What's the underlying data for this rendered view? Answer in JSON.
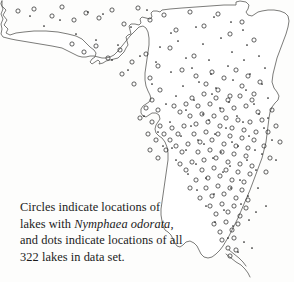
{
  "figure": {
    "kind": "distribution-map",
    "region": "Florida",
    "background_color": "#fdfdfc",
    "outline_color": "#5a5a58",
    "marker_color": "#2e2e2e",
    "dot_color": "#1a1a1a"
  },
  "caption": {
    "line1": "Circles indicate locations of",
    "line2_prefix": "lakes with ",
    "line2_species": "Nymphaea odorata",
    "line2_suffix": ",",
    "line3": "and dots indicate locations of all",
    "line4": "322 lakes in data set."
  },
  "legend_semantics": {
    "circle_meaning": "locations of lakes with Nymphaea odorata",
    "dot_meaning": "locations of all lakes in data set",
    "total_lakes": "322"
  },
  "chart_data": {
    "type": "scatter",
    "title": "",
    "xlabel": "",
    "ylabel": "",
    "grid": false,
    "legend_position": "caption-below",
    "xlim": [
      0,
      294
    ],
    "ylim": [
      0,
      282
    ],
    "series": [
      {
        "name": "All lakes in data set (dots)",
        "marker": "dot",
        "count_label": "322",
        "points": [
          [
            103,
            14
          ],
          [
            147,
            10
          ],
          [
            171,
            33
          ],
          [
            196,
            27
          ],
          [
            214,
            17
          ],
          [
            231,
            22
          ],
          [
            243,
            30
          ],
          [
            96,
            40
          ],
          [
            118,
            45
          ],
          [
            131,
            27
          ],
          [
            160,
            47
          ],
          [
            178,
            41
          ],
          [
            203,
            44
          ],
          [
            221,
            38
          ],
          [
            140,
            56
          ],
          [
            156,
            62
          ],
          [
            186,
            58
          ],
          [
            209,
            60
          ],
          [
            232,
            52
          ],
          [
            247,
            45
          ],
          [
            171,
            72
          ],
          [
            192,
            68
          ],
          [
            211,
            74
          ],
          [
            228,
            66
          ],
          [
            244,
            60
          ],
          [
            259,
            56
          ],
          [
            183,
            86
          ],
          [
            199,
            82
          ],
          [
            216,
            88
          ],
          [
            233,
            80
          ],
          [
            250,
            74
          ],
          [
            265,
            68
          ],
          [
            176,
            96
          ],
          [
            194,
            100
          ],
          [
            212,
            94
          ],
          [
            229,
            102
          ],
          [
            246,
            90
          ],
          [
            262,
            84
          ],
          [
            186,
            110
          ],
          [
            203,
            114
          ],
          [
            220,
            108
          ],
          [
            237,
            116
          ],
          [
            254,
            104
          ],
          [
            268,
            98
          ],
          [
            170,
            122
          ],
          [
            191,
            126
          ],
          [
            209,
            120
          ],
          [
            226,
            128
          ],
          [
            243,
            122
          ],
          [
            259,
            114
          ],
          [
            181,
            136
          ],
          [
            198,
            140
          ],
          [
            215,
            134
          ],
          [
            232,
            142
          ],
          [
            249,
            136
          ],
          [
            264,
            128
          ],
          [
            163,
            146
          ],
          [
            186,
            150
          ],
          [
            204,
            144
          ],
          [
            221,
            152
          ],
          [
            238,
            146
          ],
          [
            255,
            150
          ],
          [
            176,
            160
          ],
          [
            196,
            164
          ],
          [
            213,
            158
          ],
          [
            230,
            166
          ],
          [
            247,
            160
          ],
          [
            262,
            154
          ],
          [
            188,
            174
          ],
          [
            206,
            178
          ],
          [
            223,
            172
          ],
          [
            240,
            180
          ],
          [
            256,
            170
          ],
          [
            197,
            190
          ],
          [
            214,
            194
          ],
          [
            231,
            188
          ],
          [
            248,
            196
          ],
          [
            206,
            206
          ],
          [
            224,
            210
          ],
          [
            241,
            204
          ],
          [
            256,
            212
          ],
          [
            215,
            222
          ],
          [
            233,
            226
          ],
          [
            249,
            220
          ],
          [
            228,
            238
          ],
          [
            244,
            242
          ],
          [
            238,
            252
          ],
          [
            252,
            248
          ],
          [
            60,
            20
          ],
          [
            76,
            34
          ],
          [
            88,
            12
          ],
          [
            112,
            60
          ],
          [
            128,
            70
          ],
          [
            44,
            26
          ],
          [
            30,
            16
          ],
          [
            152,
            84
          ],
          [
            166,
            104
          ],
          [
            144,
            116
          ],
          [
            158,
            132
          ],
          [
            172,
            148
          ],
          [
            268,
            118
          ],
          [
            272,
            140
          ],
          [
            276,
            160
          ],
          [
            258,
            188
          ],
          [
            266,
            206
          ]
        ]
      },
      {
        "name": "Lakes with Nymphaea odorata (circles)",
        "marker": "open-circle",
        "points": [
          [
            18,
            11
          ],
          [
            34,
            9
          ],
          [
            52,
            16
          ],
          [
            62,
            7
          ],
          [
            74,
            20
          ],
          [
            86,
            13
          ],
          [
            99,
            18
          ],
          [
            112,
            10
          ],
          [
            124,
            24
          ],
          [
            138,
            8
          ],
          [
            150,
            20
          ],
          [
            164,
            15
          ],
          [
            176,
            30
          ],
          [
            190,
            12
          ],
          [
            204,
            26
          ],
          [
            218,
            14
          ],
          [
            230,
            34
          ],
          [
            242,
            22
          ],
          [
            254,
            40
          ],
          [
            72,
            44
          ],
          [
            84,
            52
          ],
          [
            96,
            46
          ],
          [
            108,
            58
          ],
          [
            120,
            50
          ],
          [
            132,
            62
          ],
          [
            146,
            54
          ],
          [
            158,
            66
          ],
          [
            170,
            48
          ],
          [
            182,
            70
          ],
          [
            194,
            56
          ],
          [
            122,
            74
          ],
          [
            134,
            84
          ],
          [
            150,
            78
          ],
          [
            160,
            90
          ],
          [
            196,
            76
          ],
          [
            206,
            84
          ],
          [
            212,
            72
          ],
          [
            218,
            90
          ],
          [
            224,
            78
          ],
          [
            230,
            96
          ],
          [
            236,
            70
          ],
          [
            242,
            86
          ],
          [
            248,
            76
          ],
          [
            254,
            94
          ],
          [
            260,
            82
          ],
          [
            192,
            98
          ],
          [
            198,
            106
          ],
          [
            204,
            94
          ],
          [
            210,
            104
          ],
          [
            216,
            98
          ],
          [
            222,
            110
          ],
          [
            228,
            100
          ],
          [
            234,
            108
          ],
          [
            240,
            96
          ],
          [
            246,
            106
          ],
          [
            252,
            100
          ],
          [
            258,
            112
          ],
          [
            186,
            104
          ],
          [
            180,
            112
          ],
          [
            174,
            106
          ],
          [
            190,
            116
          ],
          [
            196,
            124
          ],
          [
            202,
            114
          ],
          [
            208,
            122
          ],
          [
            214,
            116
          ],
          [
            220,
            126
          ],
          [
            226,
            118
          ],
          [
            232,
            128
          ],
          [
            238,
            120
          ],
          [
            244,
            130
          ],
          [
            250,
            122
          ],
          [
            256,
            132
          ],
          [
            184,
            126
          ],
          [
            178,
            134
          ],
          [
            172,
            128
          ],
          [
            194,
            134
          ],
          [
            200,
            142
          ],
          [
            206,
            132
          ],
          [
            212,
            140
          ],
          [
            218,
            134
          ],
          [
            224,
            144
          ],
          [
            230,
            136
          ],
          [
            236,
            146
          ],
          [
            242,
            138
          ],
          [
            248,
            148
          ],
          [
            254,
            140
          ],
          [
            188,
            144
          ],
          [
            182,
            152
          ],
          [
            176,
            146
          ],
          [
            170,
            140
          ],
          [
            198,
            152
          ],
          [
            204,
            160
          ],
          [
            210,
            150
          ],
          [
            216,
            158
          ],
          [
            222,
            152
          ],
          [
            228,
            162
          ],
          [
            234,
            154
          ],
          [
            240,
            164
          ],
          [
            246,
            156
          ],
          [
            252,
            166
          ],
          [
            192,
            162
          ],
          [
            186,
            170
          ],
          [
            180,
            164
          ],
          [
            202,
            170
          ],
          [
            208,
            178
          ],
          [
            214,
            168
          ],
          [
            220,
            176
          ],
          [
            226,
            170
          ],
          [
            232,
            180
          ],
          [
            238,
            172
          ],
          [
            244,
            182
          ],
          [
            250,
            174
          ],
          [
            196,
            180
          ],
          [
            190,
            188
          ],
          [
            206,
            188
          ],
          [
            212,
            196
          ],
          [
            218,
            186
          ],
          [
            224,
            194
          ],
          [
            230,
            188
          ],
          [
            236,
            198
          ],
          [
            242,
            190
          ],
          [
            248,
            200
          ],
          [
            200,
            198
          ],
          [
            210,
            206
          ],
          [
            216,
            214
          ],
          [
            222,
            204
          ],
          [
            228,
            212
          ],
          [
            234,
            206
          ],
          [
            240,
            216
          ],
          [
            246,
            208
          ],
          [
            214,
            224
          ],
          [
            220,
            232
          ],
          [
            226,
            222
          ],
          [
            232,
            230
          ],
          [
            238,
            224
          ],
          [
            222,
            240
          ],
          [
            228,
            248
          ],
          [
            234,
            238
          ],
          [
            230,
            256
          ],
          [
            236,
            250
          ],
          [
            152,
            100
          ],
          [
            158,
            110
          ],
          [
            146,
            108
          ],
          [
            140,
            118
          ],
          [
            152,
            122
          ],
          [
            160,
            126
          ],
          [
            148,
            134
          ],
          [
            156,
            140
          ],
          [
            164,
            134
          ],
          [
            150,
            150
          ],
          [
            158,
            158
          ],
          [
            166,
            150
          ],
          [
            262,
            120
          ],
          [
            268,
            132
          ],
          [
            264,
            146
          ],
          [
            270,
            158
          ],
          [
            266,
            172
          ],
          [
            272,
            110
          ],
          [
            276,
            126
          ],
          [
            280,
            142
          ]
        ]
      }
    ]
  }
}
